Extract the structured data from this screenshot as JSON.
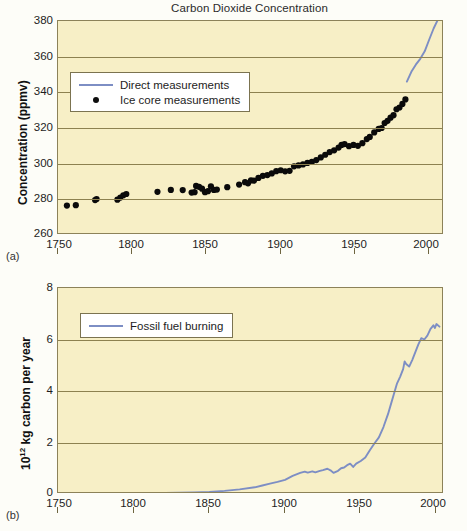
{
  "figure": {
    "panel_a_letter": "(a)",
    "panel_b_letter": "(b)"
  },
  "chart_data": [
    {
      "id": "co2",
      "type": "scatter",
      "title": "Carbon Dioxide Concentration",
      "xlabel": "",
      "ylabel": "Concentration (ppmv)",
      "xlim": [
        1750,
        2010
      ],
      "ylim": [
        260,
        380
      ],
      "xticks": [
        1750,
        1800,
        1850,
        1900,
        1950,
        2000
      ],
      "yticks": [
        260,
        280,
        300,
        320,
        340,
        360,
        380
      ],
      "grid": true,
      "legend_position": "upper left",
      "series": [
        {
          "name": "Direct measurements",
          "type": "line",
          "color": "#7d8ec4",
          "points": [
            [
              1985,
              346.0
            ],
            [
              1988,
              351.5
            ],
            [
              1991,
              355.5
            ],
            [
              1994,
              358.8
            ],
            [
              1997,
              363.0
            ],
            [
              2000,
              369.5
            ],
            [
              2003,
              375.8
            ],
            [
              2006,
              381.0
            ],
            [
              2007,
              383.0
            ]
          ]
        },
        {
          "name": "Ice core measurements",
          "type": "scatter",
          "color": "#0a0a0a",
          "points": [
            [
              1756,
              276.5
            ],
            [
              1762,
              276.7
            ],
            [
              1775,
              279.6
            ],
            [
              1776,
              280.2
            ],
            [
              1790,
              279.8
            ],
            [
              1792,
              281.0
            ],
            [
              1794,
              282.3
            ],
            [
              1796,
              283.0
            ],
            [
              1817,
              284.2
            ],
            [
              1826,
              285.3
            ],
            [
              1834,
              285.2
            ],
            [
              1840,
              283.8
            ],
            [
              1842,
              284.0
            ],
            [
              1843,
              287.5
            ],
            [
              1845,
              287.0
            ],
            [
              1847,
              286.0
            ],
            [
              1849,
              284.0
            ],
            [
              1851,
              284.6
            ],
            [
              1853,
              287.3
            ],
            [
              1855,
              285.3
            ],
            [
              1857,
              285.5
            ],
            [
              1864,
              286.8
            ],
            [
              1872,
              288.3
            ],
            [
              1876,
              289.6
            ],
            [
              1878,
              289.0
            ],
            [
              1880,
              290.6
            ],
            [
              1882,
              290.5
            ],
            [
              1885,
              292.0
            ],
            [
              1888,
              293.2
            ],
            [
              1891,
              293.6
            ],
            [
              1894,
              294.5
            ],
            [
              1897,
              295.8
            ],
            [
              1900,
              296.3
            ],
            [
              1903,
              295.7
            ],
            [
              1906,
              296.0
            ],
            [
              1909,
              298.5
            ],
            [
              1912,
              299.0
            ],
            [
              1915,
              299.6
            ],
            [
              1918,
              300.4
            ],
            [
              1921,
              301.0
            ],
            [
              1924,
              302.0
            ],
            [
              1927,
              303.5
            ],
            [
              1930,
              305.0
            ],
            [
              1933,
              306.5
            ],
            [
              1936,
              307.5
            ],
            [
              1939,
              309.0
            ],
            [
              1941,
              310.5
            ],
            [
              1943,
              311.0
            ],
            [
              1946,
              309.8
            ],
            [
              1949,
              310.5
            ],
            [
              1952,
              310.0
            ],
            [
              1955,
              311.5
            ],
            [
              1958,
              313.8
            ],
            [
              1960,
              315.0
            ],
            [
              1963,
              317.5
            ],
            [
              1966,
              319.5
            ],
            [
              1968,
              320.0
            ],
            [
              1970,
              322.8
            ],
            [
              1972,
              324.0
            ],
            [
              1974,
              325.8
            ],
            [
              1976,
              327.2
            ],
            [
              1978,
              330.5
            ],
            [
              1980,
              331.5
            ],
            [
              1982,
              333.5
            ],
            [
              1984,
              336.0
            ]
          ]
        }
      ]
    },
    {
      "id": "fossil-fuel",
      "type": "line",
      "title": "",
      "xlabel": "",
      "ylabel": "10^12 kg carbon per year",
      "ylabel_prefix": "10",
      "ylabel_exponent": "12",
      "ylabel_suffix": " kg carbon per year",
      "xlim": [
        1750,
        2005
      ],
      "ylim": [
        0,
        8
      ],
      "xticks": [
        1750,
        1800,
        1850,
        1900,
        1950,
        2000
      ],
      "yticks": [
        0,
        2,
        4,
        6,
        8
      ],
      "grid": true,
      "legend_position": "upper left",
      "series": [
        {
          "name": "Fossil fuel burning",
          "type": "line",
          "color": "#7d8ec4",
          "points": [
            [
              1750,
              0.01
            ],
            [
              1800,
              0.03
            ],
            [
              1820,
              0.04
            ],
            [
              1840,
              0.06
            ],
            [
              1850,
              0.08
            ],
            [
              1860,
              0.12
            ],
            [
              1870,
              0.18
            ],
            [
              1880,
              0.26
            ],
            [
              1885,
              0.33
            ],
            [
              1890,
              0.4
            ],
            [
              1895,
              0.47
            ],
            [
              1900,
              0.55
            ],
            [
              1905,
              0.7
            ],
            [
              1910,
              0.82
            ],
            [
              1913,
              0.87
            ],
            [
              1915,
              0.83
            ],
            [
              1918,
              0.88
            ],
            [
              1920,
              0.84
            ],
            [
              1923,
              0.9
            ],
            [
              1925,
              0.93
            ],
            [
              1928,
              0.98
            ],
            [
              1930,
              0.92
            ],
            [
              1932,
              0.82
            ],
            [
              1935,
              0.9
            ],
            [
              1937,
              1.0
            ],
            [
              1939,
              1.03
            ],
            [
              1941,
              1.12
            ],
            [
              1943,
              1.18
            ],
            [
              1945,
              1.05
            ],
            [
              1947,
              1.18
            ],
            [
              1950,
              1.28
            ],
            [
              1953,
              1.42
            ],
            [
              1956,
              1.7
            ],
            [
              1959,
              1.96
            ],
            [
              1962,
              2.2
            ],
            [
              1965,
              2.6
            ],
            [
              1968,
              3.1
            ],
            [
              1970,
              3.5
            ],
            [
              1972,
              3.9
            ],
            [
              1974,
              4.3
            ],
            [
              1976,
              4.55
            ],
            [
              1978,
              4.85
            ],
            [
              1979,
              5.15
            ],
            [
              1980,
              5.05
            ],
            [
              1982,
              4.95
            ],
            [
              1984,
              5.2
            ],
            [
              1986,
              5.5
            ],
            [
              1988,
              5.8
            ],
            [
              1990,
              6.05
            ],
            [
              1992,
              6.0
            ],
            [
              1994,
              6.15
            ],
            [
              1996,
              6.4
            ],
            [
              1998,
              6.55
            ],
            [
              1999,
              6.45
            ],
            [
              2000,
              6.6
            ],
            [
              2002,
              6.5
            ]
          ]
        }
      ]
    }
  ],
  "plot_a": {
    "title": "Carbon Dioxide Concentration",
    "ylabel": "Concentration (ppmv)",
    "yticks": [
      "380",
      "360",
      "340",
      "320",
      "300",
      "280",
      "260"
    ],
    "xticks": [
      "1750",
      "1800",
      "1850",
      "1900",
      "1950",
      "2000"
    ],
    "legend": [
      {
        "label": "Direct measurements",
        "key": "line-swatch"
      },
      {
        "label": "Ice core measurements",
        "key": "dot-swatch"
      }
    ]
  },
  "plot_b": {
    "ylabel_prefix": "10",
    "ylabel_exponent": "12",
    "ylabel_suffix": " kg carbon per year",
    "yticks": [
      "8",
      "6",
      "4",
      "2",
      "0"
    ],
    "xticks": [
      "1750",
      "1800",
      "1850",
      "1900",
      "1950",
      "2000"
    ],
    "legend": [
      {
        "label": "Fossil fuel burning",
        "key": "line-swatch"
      }
    ]
  },
  "colors": {
    "plot_background": "#f7efc6",
    "gridline": "#8d8150",
    "line_series": "#7d8ec4",
    "ice_core_dots": "#0a0a0a",
    "page_background": "#fdfdf8"
  }
}
